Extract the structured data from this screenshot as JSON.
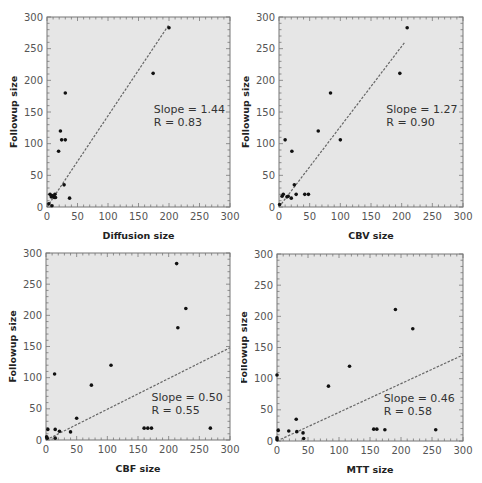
{
  "chart_data": [
    {
      "type": "scatter",
      "title": "",
      "xlabel": "Diffusion size",
      "ylabel": "Followup size",
      "xlim": [
        0,
        300
      ],
      "ylim": [
        0,
        300
      ],
      "xticks": [
        0,
        50,
        100,
        150,
        200,
        250,
        300
      ],
      "yticks": [
        0,
        50,
        100,
        150,
        200,
        250,
        300
      ],
      "grid": false,
      "annotation": {
        "slope": "Slope = 1.44",
        "r": "R = 0.83"
      },
      "fit_line": {
        "x": [
          0,
          200
        ],
        "y": [
          0,
          288
        ]
      },
      "points": [
        [
          200,
          283
        ],
        [
          174,
          211
        ],
        [
          30,
          180
        ],
        [
          22,
          120
        ],
        [
          24,
          106
        ],
        [
          30,
          106
        ],
        [
          19,
          88
        ],
        [
          28,
          35
        ],
        [
          37,
          14
        ],
        [
          5,
          20
        ],
        [
          8,
          18
        ],
        [
          10,
          17
        ],
        [
          13,
          20
        ],
        [
          7,
          16
        ],
        [
          12,
          15
        ],
        [
          14,
          15
        ],
        [
          3,
          5
        ],
        [
          8,
          2
        ]
      ]
    },
    {
      "type": "scatter",
      "title": "",
      "xlabel": "CBV size",
      "ylabel": "Followup size",
      "xlim": [
        0,
        300
      ],
      "ylim": [
        0,
        300
      ],
      "xticks": [
        0,
        50,
        100,
        150,
        200,
        250,
        300
      ],
      "yticks": [
        0,
        50,
        100,
        150,
        200,
        250,
        300
      ],
      "grid": false,
      "annotation": {
        "slope": "Slope = 1.27",
        "r": "R = 0.90"
      },
      "fit_line": {
        "x": [
          0,
          205
        ],
        "y": [
          0,
          260
        ]
      },
      "points": [
        [
          209,
          283
        ],
        [
          197,
          211
        ],
        [
          84,
          180
        ],
        [
          64,
          120
        ],
        [
          10,
          106
        ],
        [
          100,
          106
        ],
        [
          21,
          88
        ],
        [
          25,
          35
        ],
        [
          5,
          17
        ],
        [
          7,
          20
        ],
        [
          13,
          16
        ],
        [
          15,
          17
        ],
        [
          20,
          14
        ],
        [
          28,
          20
        ],
        [
          42,
          20
        ],
        [
          48,
          20
        ],
        [
          1,
          4
        ]
      ]
    },
    {
      "type": "scatter",
      "title": "",
      "xlabel": "CBF size",
      "ylabel": "Followup size",
      "xlim": [
        0,
        300
      ],
      "ylim": [
        0,
        300
      ],
      "xticks": [
        0,
        50,
        100,
        150,
        200,
        250,
        300
      ],
      "yticks": [
        0,
        50,
        100,
        150,
        200,
        250,
        300
      ],
      "grid": false,
      "annotation": {
        "slope": "Slope = 0.50",
        "r": "R = 0.55"
      },
      "fit_line": {
        "x": [
          0,
          300
        ],
        "y": [
          0,
          148
        ]
      },
      "points": [
        [
          213,
          283
        ],
        [
          228,
          211
        ],
        [
          215,
          180
        ],
        [
          106,
          120
        ],
        [
          14,
          106
        ],
        [
          74,
          88
        ],
        [
          50,
          35
        ],
        [
          3,
          17
        ],
        [
          15,
          17
        ],
        [
          22,
          14
        ],
        [
          40,
          13
        ],
        [
          160,
          19
        ],
        [
          166,
          19
        ],
        [
          172,
          19
        ],
        [
          268,
          19
        ],
        [
          15,
          3
        ],
        [
          1,
          5
        ],
        [
          2,
          3
        ]
      ]
    },
    {
      "type": "scatter",
      "title": "",
      "xlabel": "MTT size",
      "ylabel": "Followup size",
      "xlim": [
        0,
        300
      ],
      "ylim": [
        0,
        300
      ],
      "xticks": [
        0,
        50,
        100,
        150,
        200,
        250,
        300
      ],
      "yticks": [
        0,
        50,
        100,
        150,
        200,
        250,
        300
      ],
      "grid": false,
      "annotation": {
        "slope": "Slope = 0.46",
        "r": "R = 0.58"
      },
      "fit_line": {
        "x": [
          0,
          300
        ],
        "y": [
          0,
          138
        ]
      },
      "points": [
        [
          191,
          211
        ],
        [
          219,
          180
        ],
        [
          117,
          120
        ],
        [
          0,
          106
        ],
        [
          83,
          88
        ],
        [
          31,
          35
        ],
        [
          2,
          17
        ],
        [
          19,
          16
        ],
        [
          32,
          15
        ],
        [
          42,
          13
        ],
        [
          43,
          4
        ],
        [
          156,
          19
        ],
        [
          161,
          19
        ],
        [
          174,
          18
        ],
        [
          256,
          18
        ],
        [
          0,
          5
        ],
        [
          0,
          2
        ]
      ]
    }
  ],
  "layout": {
    "panels": [
      {
        "left": 0,
        "top": 0,
        "plot": {
          "x0": 47,
          "y0": 17,
          "x1": 230,
          "y1": 207
        }
      },
      {
        "left": 241,
        "top": 0,
        "plot": {
          "x0": 38,
          "y0": 17,
          "x1": 222,
          "y1": 207
        }
      },
      {
        "left": 0,
        "top": 243,
        "plot": {
          "x0": 46,
          "y0": 10,
          "x1": 230,
          "y1": 197
        }
      },
      {
        "left": 241,
        "top": 243,
        "plot": {
          "x0": 36,
          "y0": 11,
          "x1": 222,
          "y1": 198
        }
      }
    ],
    "colors": {
      "plot_bg": "#e6e6e6",
      "frame": "#777777",
      "point": "#111111",
      "fit_line": "#666666"
    }
  }
}
